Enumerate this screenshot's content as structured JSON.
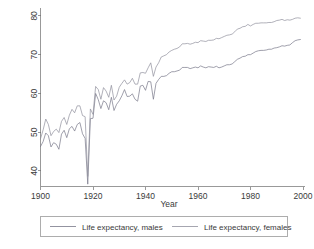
{
  "chart_data": {
    "type": "line",
    "title": "",
    "xlabel": "Year",
    "ylabel": "",
    "xlim": [
      1900,
      2000
    ],
    "ylim": [
      36,
      81
    ],
    "grid": false,
    "legend_position": "bottom",
    "xticks": [
      1900,
      1920,
      1940,
      1960,
      1980,
      2000
    ],
    "yticks": [
      40,
      50,
      60,
      70,
      80
    ],
    "xticklabels": [
      "1900",
      "1920",
      "1940",
      "1960",
      "1980",
      "2000"
    ],
    "yticklabels": [
      "40",
      "50",
      "60",
      "70",
      "80"
    ],
    "x": [
      1900,
      1901,
      1902,
      1903,
      1904,
      1905,
      1906,
      1907,
      1908,
      1909,
      1910,
      1911,
      1912,
      1913,
      1914,
      1915,
      1916,
      1917,
      1918,
      1919,
      1920,
      1921,
      1922,
      1923,
      1924,
      1925,
      1926,
      1927,
      1928,
      1929,
      1930,
      1931,
      1932,
      1933,
      1934,
      1935,
      1936,
      1937,
      1938,
      1939,
      1940,
      1941,
      1942,
      1943,
      1944,
      1945,
      1946,
      1947,
      1948,
      1949,
      1950,
      1951,
      1952,
      1953,
      1954,
      1955,
      1956,
      1957,
      1958,
      1959,
      1960,
      1961,
      1962,
      1963,
      1964,
      1965,
      1966,
      1967,
      1968,
      1969,
      1970,
      1971,
      1972,
      1973,
      1974,
      1975,
      1976,
      1977,
      1978,
      1979,
      1980,
      1981,
      1982,
      1983,
      1984,
      1985,
      1986,
      1987,
      1988,
      1989,
      1990,
      1991,
      1992,
      1993,
      1994,
      1995,
      1996,
      1997,
      1998,
      1999
    ],
    "series": [
      {
        "name": "Life expectancy, males",
        "color": "#777788",
        "values": [
          46.3,
          47.6,
          49.8,
          49.1,
          46.2,
          47.3,
          46.9,
          45.6,
          49.5,
          50.5,
          48.6,
          50.9,
          51.5,
          50.3,
          52.0,
          52.5,
          49.6,
          48.4,
          36.6,
          53.5,
          53.6,
          60.0,
          58.4,
          56.1,
          58.1,
          57.6,
          55.8,
          59.0,
          55.6,
          57.2,
          58.1,
          59.4,
          61.0,
          59.2,
          59.3,
          59.9,
          58.5,
          58.0,
          61.9,
          62.1,
          60.8,
          63.1,
          63.0,
          58.5,
          62.6,
          63.6,
          64.4,
          64.4,
          64.6,
          65.2,
          65.6,
          65.6,
          65.8,
          66.0,
          66.7,
          66.7,
          66.7,
          66.4,
          66.6,
          66.8,
          66.6,
          67.1,
          66.8,
          66.6,
          66.9,
          66.8,
          66.7,
          67.0,
          66.6,
          66.8,
          67.1,
          67.4,
          67.4,
          67.6,
          68.2,
          68.8,
          69.1,
          69.5,
          69.6,
          70.0,
          70.0,
          70.4,
          70.8,
          71.0,
          71.1,
          71.1,
          71.2,
          71.4,
          71.4,
          71.7,
          71.8,
          72.0,
          72.3,
          72.2,
          72.4,
          72.5,
          73.1,
          73.6,
          73.8,
          73.9
        ]
      },
      {
        "name": "Life expectancy, females",
        "color": "#8f8f9c",
        "values": [
          48.3,
          50.6,
          53.4,
          52.0,
          49.1,
          50.2,
          50.8,
          49.9,
          52.8,
          53.8,
          52.0,
          54.4,
          55.9,
          55.0,
          56.8,
          56.8,
          54.3,
          54.0,
          38.6,
          56.0,
          54.6,
          61.8,
          61.0,
          58.5,
          61.5,
          60.6,
          59.0,
          62.1,
          58.3,
          59.3,
          61.6,
          62.6,
          63.5,
          62.4,
          62.8,
          63.9,
          62.4,
          62.4,
          65.3,
          65.4,
          65.2,
          66.6,
          67.9,
          64.4,
          66.8,
          67.9,
          69.4,
          69.7,
          70.0,
          70.7,
          71.1,
          71.4,
          71.6,
          72.0,
          72.8,
          72.8,
          72.9,
          72.7,
          72.9,
          73.2,
          73.1,
          73.6,
          73.5,
          73.4,
          73.7,
          73.7,
          73.8,
          74.2,
          74.1,
          74.4,
          74.7,
          75.0,
          75.1,
          75.3,
          75.9,
          76.6,
          76.8,
          77.2,
          77.3,
          77.8,
          77.4,
          77.8,
          78.1,
          78.1,
          78.2,
          78.2,
          78.2,
          78.3,
          78.3,
          78.5,
          78.8,
          78.9,
          79.1,
          78.8,
          79.0,
          78.9,
          79.1,
          79.4,
          79.5,
          79.4
        ]
      }
    ]
  },
  "axis": {
    "x_title": "Year"
  },
  "legend": {
    "entries": [
      {
        "label": "Life expectancy, males"
      },
      {
        "label": "Life expectancy, females"
      }
    ]
  }
}
